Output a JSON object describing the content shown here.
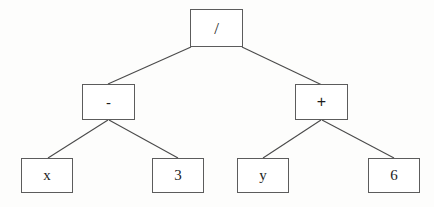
{
  "diagram": {
    "type": "binary-expression-tree",
    "expression": "(x - 3) / (y + 6)",
    "background_color": "#fdfdfc",
    "border_color": "#5c5c5c",
    "text_color": "#1d1d1d",
    "edge_color": "#4a4a4a"
  },
  "nodes": {
    "root": {
      "label": "/",
      "role": "operator",
      "x": 190,
      "y": 9,
      "w": 53,
      "h": 38
    },
    "left_op": {
      "label": "-",
      "role": "operator",
      "x": 82,
      "y": 84,
      "w": 53,
      "h": 36
    },
    "right_op": {
      "label": "+",
      "role": "operator",
      "x": 295,
      "y": 84,
      "w": 53,
      "h": 36
    },
    "leaf_x": {
      "label": "x",
      "role": "operand",
      "x": 21,
      "y": 158,
      "w": 52,
      "h": 35
    },
    "leaf_3": {
      "label": "3",
      "role": "operand",
      "x": 152,
      "y": 158,
      "w": 52,
      "h": 35
    },
    "leaf_y": {
      "label": "y",
      "role": "operand",
      "x": 237,
      "y": 158,
      "w": 52,
      "h": 35
    },
    "leaf_6": {
      "label": "6",
      "role": "operand",
      "x": 368,
      "y": 158,
      "w": 52,
      "h": 35
    }
  },
  "edges": [
    {
      "from": "root",
      "to": "left_op",
      "x1": 191,
      "y1": 47,
      "x2": 108,
      "y2": 84
    },
    {
      "from": "root",
      "to": "right_op",
      "x1": 242,
      "y1": 47,
      "x2": 322,
      "y2": 85
    },
    {
      "from": "left_op",
      "to": "leaf_x",
      "x1": 108,
      "y1": 120,
      "x2": 48,
      "y2": 158
    },
    {
      "from": "left_op",
      "to": "leaf_3",
      "x1": 109,
      "y1": 120,
      "x2": 178,
      "y2": 158
    },
    {
      "from": "right_op",
      "to": "leaf_y",
      "x1": 321,
      "y1": 120,
      "x2": 263,
      "y2": 158
    },
    {
      "from": "right_op",
      "to": "leaf_6",
      "x1": 322,
      "y1": 120,
      "x2": 394,
      "y2": 158
    }
  ]
}
